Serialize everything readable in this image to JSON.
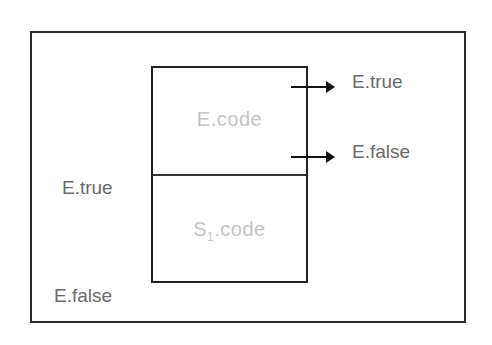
{
  "diagram": {
    "box": {
      "top_label": "E.code",
      "bottom_label_main": "S",
      "bottom_label_sub": "1",
      "bottom_label_suffix": ".code"
    },
    "exits": [
      {
        "label": "E.true"
      },
      {
        "label": "E.false"
      }
    ],
    "left_labels": [
      {
        "label": "E.true"
      },
      {
        "label": "E.false"
      }
    ],
    "colors": {
      "stroke": "#222222",
      "label_text": "#6a6a6a",
      "code_text": "#c4c4c4"
    }
  }
}
